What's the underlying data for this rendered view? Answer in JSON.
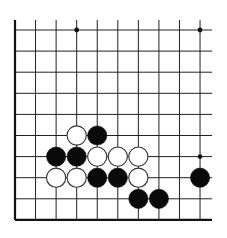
{
  "game": "go",
  "board": {
    "view": "partial board (bottom-left region), left and bottom edges visible, continues upward and to the right",
    "columns_visible": 10,
    "rows_visible": 10,
    "origin_x": 15,
    "origin_y": 30,
    "spacing_x": 20.56,
    "spacing_y": 21.1,
    "top_extension_y": 20,
    "right_extension_x": 212,
    "line_color": "#222222",
    "edge_color": "#111111",
    "background": "#ffffff"
  },
  "star_points": [
    {
      "col": 3,
      "row": 0
    },
    {
      "col": 9,
      "row": 0
    },
    {
      "col": 9,
      "row": 6
    }
  ],
  "stones": [
    {
      "color": "white",
      "col": 3,
      "row": 5
    },
    {
      "color": "black",
      "col": 4,
      "row": 5
    },
    {
      "color": "black",
      "col": 2,
      "row": 6
    },
    {
      "color": "black",
      "col": 3,
      "row": 6
    },
    {
      "color": "white",
      "col": 4,
      "row": 6
    },
    {
      "color": "white",
      "col": 5,
      "row": 6
    },
    {
      "color": "white",
      "col": 6,
      "row": 6
    },
    {
      "color": "white",
      "col": 2,
      "row": 7
    },
    {
      "color": "white",
      "col": 3,
      "row": 7
    },
    {
      "color": "black",
      "col": 4,
      "row": 7
    },
    {
      "color": "black",
      "col": 5,
      "row": 7
    },
    {
      "color": "white",
      "col": 6,
      "row": 7
    },
    {
      "color": "black",
      "col": 9,
      "row": 7
    },
    {
      "color": "black",
      "col": 6,
      "row": 8
    },
    {
      "color": "black",
      "col": 7,
      "row": 8
    }
  ],
  "stone_style": {
    "radius": 9.6,
    "black_fill": "#0a0a0a",
    "white_fill": "#ffffff",
    "white_stroke": "#333333"
  }
}
